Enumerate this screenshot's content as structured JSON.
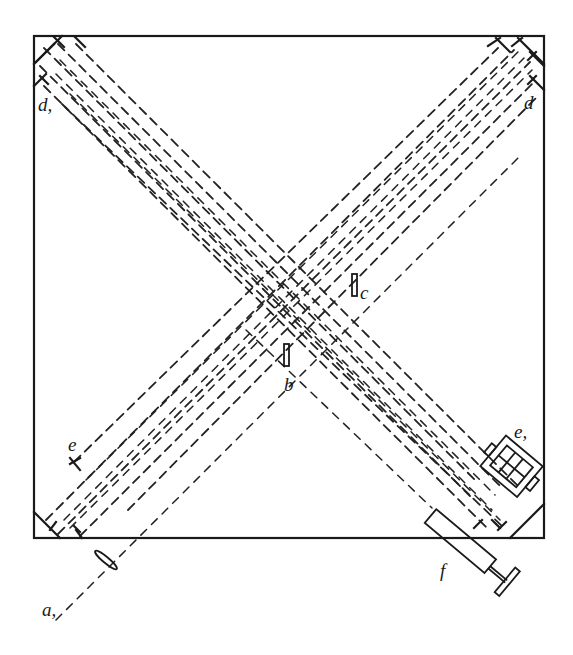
{
  "figure": {
    "type": "optical-apparatus-schematic",
    "frame": {
      "x": 34,
      "y": 36,
      "width": 510,
      "height": 502
    },
    "labels": [
      {
        "id": "d1",
        "text": "d,",
        "x": 38,
        "y": 111
      },
      {
        "id": "d",
        "text": "d",
        "x": 524,
        "y": 109
      },
      {
        "id": "c",
        "text": "c",
        "x": 360,
        "y": 299
      },
      {
        "id": "b",
        "text": "b",
        "x": 284,
        "y": 391
      },
      {
        "id": "e",
        "text": "e",
        "x": 68,
        "y": 451
      },
      {
        "id": "e1",
        "text": "e,",
        "x": 514,
        "y": 438
      },
      {
        "id": "f",
        "text": "f",
        "x": 440,
        "y": 577
      },
      {
        "id": "a",
        "text": "a,",
        "x": 42,
        "y": 616
      }
    ],
    "components": [
      {
        "name": "lens",
        "label": "a,"
      },
      {
        "name": "plate-b",
        "label": "b"
      },
      {
        "name": "plate-c",
        "label": "c"
      },
      {
        "name": "mirror-set-d",
        "label": "d"
      },
      {
        "name": "mirror-set-d1",
        "label": "d,"
      },
      {
        "name": "mirror-e",
        "label": "e"
      },
      {
        "name": "mirror-e1",
        "label": "e,"
      },
      {
        "name": "telescope",
        "label": "f"
      }
    ]
  }
}
